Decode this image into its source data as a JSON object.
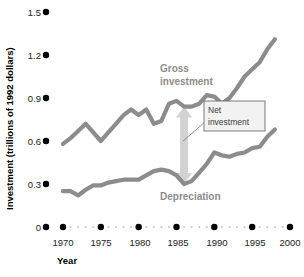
{
  "chart_data": {
    "type": "line",
    "title": "",
    "xlabel": "Year",
    "ylabel": "Investment (trillions of 1992 dollars)",
    "xlim": [
      1969,
      2000
    ],
    "ylim": [
      0,
      1.5
    ],
    "yticks": [
      "0",
      "0.3",
      "0.6",
      "0.9",
      "1.2",
      "1.5"
    ],
    "ytick_values": [
      0,
      0.3,
      0.6,
      0.9,
      1.2,
      1.5
    ],
    "xticks": [
      "1970",
      "1975",
      "1980",
      "1985",
      "1990",
      "1995",
      "2000"
    ],
    "xtick_values": [
      1970,
      1975,
      1980,
      1985,
      1990,
      1995,
      2000
    ],
    "grid": false,
    "legend_position": "inline-labels",
    "x": [
      1970,
      1971,
      1972,
      1973,
      1974,
      1975,
      1976,
      1977,
      1978,
      1979,
      1980,
      1981,
      1982,
      1983,
      1984,
      1985,
      1986,
      1987,
      1988,
      1989,
      1990,
      1991,
      1992,
      1993,
      1994,
      1995,
      1996,
      1997,
      1998
    ],
    "series": [
      {
        "name": "Gross investment",
        "color": "#8c8c8c",
        "values": [
          0.58,
          0.62,
          0.67,
          0.72,
          0.66,
          0.6,
          0.66,
          0.72,
          0.78,
          0.82,
          0.78,
          0.82,
          0.72,
          0.74,
          0.86,
          0.88,
          0.84,
          0.84,
          0.86,
          0.92,
          0.91,
          0.86,
          0.9,
          0.97,
          1.05,
          1.1,
          1.15,
          1.24,
          1.31
        ]
      },
      {
        "name": "Depreciation",
        "color": "#8c8c8c",
        "values": [
          0.25,
          0.25,
          0.22,
          0.26,
          0.29,
          0.29,
          0.31,
          0.32,
          0.33,
          0.33,
          0.33,
          0.36,
          0.39,
          0.4,
          0.39,
          0.36,
          0.3,
          0.32,
          0.38,
          0.44,
          0.52,
          0.5,
          0.49,
          0.51,
          0.52,
          0.55,
          0.56,
          0.63,
          0.68
        ]
      }
    ],
    "annotations": [
      {
        "name": "net-investment-callout",
        "label_line1": "Net",
        "label_line2": "investment",
        "at_year": 1986,
        "span_from": 0.3,
        "span_to": 0.84
      },
      {
        "name": "gross-investment-label",
        "label_line1": "Gross",
        "label_line2": "investment"
      },
      {
        "name": "depreciation-label",
        "label_line1": "Depreciation"
      }
    ]
  },
  "axes": {
    "ylabel": "Investment (trillions of 1992 dollars)",
    "xlabel": "Year",
    "ytick_0": "0",
    "ytick_1": "0.3",
    "ytick_2": "0.6",
    "ytick_3": "0.9",
    "ytick_4": "1.2",
    "ytick_5": "1.5",
    "xtick_0": "1970",
    "xtick_1": "1975",
    "xtick_2": "1980",
    "xtick_3": "1985",
    "xtick_4": "1990",
    "xtick_5": "1995",
    "xtick_6": "2000"
  },
  "labels": {
    "gross_line1": "Gross",
    "gross_line2": "investment",
    "depreciation": "Depreciation",
    "net_line1": "Net",
    "net_line2": "investment"
  },
  "colors": {
    "series": "#8c8c8c",
    "arrow": "#d2d2d2",
    "tick_dot": "#000000",
    "minor_dot": "#c8c8c8",
    "callout_fill": "#f2f2f2",
    "callout_border": "#6e6e6e"
  }
}
